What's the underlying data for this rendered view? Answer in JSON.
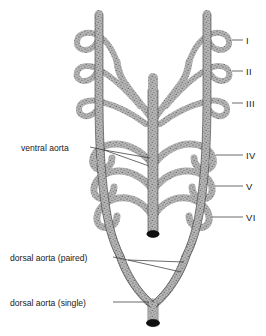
{
  "figure": {
    "background_color": "#ffffff",
    "vessel_fill_color": "#9a9a9a",
    "vessel_outline_color": "#2b2b2b",
    "leader_line_color": "#3a3a3a",
    "cut_end_color": "#101010",
    "width": 266,
    "height": 336
  },
  "arch_labels": [
    {
      "numeral": "I",
      "x": 246,
      "y": 36,
      "leader_from_x": 232,
      "leader_to_x": 243,
      "leader_y": 40,
      "arch_index": 1
    },
    {
      "numeral": "II",
      "x": 246,
      "y": 67,
      "leader_from_x": 232,
      "leader_to_x": 243,
      "leader_y": 71,
      "arch_index": 2
    },
    {
      "numeral": "III",
      "x": 246,
      "y": 99,
      "leader_from_x": 232,
      "leader_to_x": 243,
      "leader_y": 103,
      "arch_index": 3
    },
    {
      "numeral": "IV",
      "x": 246,
      "y": 151,
      "leader_from_x": 232,
      "leader_to_x": 243,
      "leader_y": 155,
      "arch_index": 4
    },
    {
      "numeral": "V",
      "x": 246,
      "y": 182,
      "leader_from_x": 232,
      "leader_to_x": 243,
      "leader_y": 186,
      "arch_index": 5
    },
    {
      "numeral": "VI",
      "x": 246,
      "y": 213,
      "leader_from_x": 232,
      "leader_to_x": 243,
      "leader_y": 217,
      "arch_index": 6
    }
  ],
  "part_labels": [
    {
      "id": "ventral-aorta",
      "text": "ventral aorta",
      "x": 21,
      "y": 144,
      "text_end_x": 88,
      "leader_y": 148
    },
    {
      "id": "dorsal-aorta-paired",
      "text": "dorsal aorta (paired)",
      "x": 10,
      "y": 254,
      "text_end_x": 112,
      "leader_y": 258
    },
    {
      "id": "dorsal-aorta-single",
      "text": "dorsal aorta (single)",
      "x": 10,
      "y": 299,
      "text_end_x": 112,
      "leader_y": 303
    }
  ],
  "structures": {
    "ventral_aorta": "median ventral trunk with cut end",
    "dorsal_aorta_paired": "bilateral dorsal aortae descending and converging",
    "dorsal_aorta_single": "fused median dorsal aorta with cut end",
    "arch_count": 6
  }
}
